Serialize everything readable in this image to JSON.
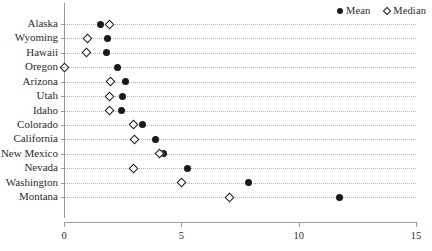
{
  "chart_data": {
    "type": "scatter",
    "title": "",
    "subtitle": "",
    "xlabel": "",
    "ylabel": "",
    "orientation": "horizontal",
    "grid": "horizontal-dotted",
    "legend_position": "top-right",
    "xlim": [
      0,
      15
    ],
    "xticks": [
      0,
      5,
      10,
      15
    ],
    "xtick_labels": [
      "0",
      "5",
      "10",
      "15"
    ],
    "categories": [
      "Alaska",
      "Wyoming",
      "Hawaii",
      "Oregon",
      "Arizona",
      "Utah",
      "Idaho",
      "Colorado",
      "California",
      "New Mexico",
      "Nevada",
      "Washington",
      "Montana"
    ],
    "series": [
      {
        "name": "Mean",
        "marker": "filled-circle",
        "color": "#1a1a1a",
        "values": [
          1.55,
          1.85,
          1.8,
          2.3,
          2.6,
          2.5,
          2.45,
          3.35,
          3.9,
          4.25,
          5.25,
          7.85,
          11.75
        ]
      },
      {
        "name": "Median",
        "marker": "open-diamond",
        "color": "#1a1a1a",
        "values": [
          1.95,
          1.0,
          0.95,
          0.0,
          2.0,
          1.95,
          1.95,
          2.95,
          3.0,
          4.05,
          2.95,
          5.0,
          7.05
        ]
      }
    ],
    "legend": [
      {
        "label": "Mean",
        "marker": "filled-circle"
      },
      {
        "label": "Median",
        "marker": "open-diamond"
      }
    ]
  }
}
